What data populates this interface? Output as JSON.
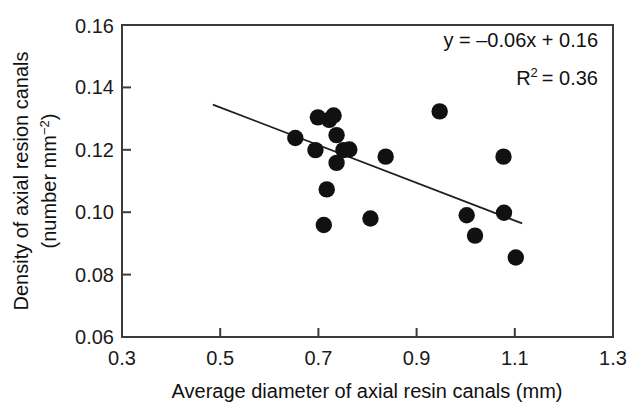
{
  "chart_data": {
    "type": "scatter",
    "title": "",
    "xlabel": "Average diameter of axial resin canals (mm)",
    "ylabel_line1": "Density of axial resion canals",
    "ylabel_line2_pre": "(number mm",
    "ylabel_line2_sup": "−2",
    "ylabel_line2_post": ")",
    "xlim": [
      0.3,
      1.3
    ],
    "ylim": [
      0.06,
      0.16
    ],
    "xticks": [
      0.3,
      0.5,
      0.7,
      0.9,
      1.1,
      1.3
    ],
    "xtick_labels": [
      "0.3",
      "0.5",
      "0.7",
      "0.9",
      "1.1",
      "1.3"
    ],
    "yticks": [
      0.06,
      0.08,
      0.1,
      0.12,
      0.14,
      0.16
    ],
    "ytick_labels": [
      "0.06",
      "0.08",
      "0.10",
      "0.12",
      "0.14",
      "0.16"
    ],
    "grid": false,
    "legend": null,
    "marker": "filled-circle",
    "marker_color": "#111111",
    "points": [
      {
        "x": 0.653,
        "y": 0.1238
      },
      {
        "x": 0.694,
        "y": 0.1199
      },
      {
        "x": 0.699,
        "y": 0.1304
      },
      {
        "x": 0.722,
        "y": 0.1296
      },
      {
        "x": 0.717,
        "y": 0.1073
      },
      {
        "x": 0.711,
        "y": 0.0959
      },
      {
        "x": 0.731,
        "y": 0.131
      },
      {
        "x": 0.737,
        "y": 0.1247
      },
      {
        "x": 0.737,
        "y": 0.1158
      },
      {
        "x": 0.751,
        "y": 0.1199
      },
      {
        "x": 0.763,
        "y": 0.1201
      },
      {
        "x": 0.806,
        "y": 0.098
      },
      {
        "x": 0.837,
        "y": 0.1178
      },
      {
        "x": 0.947,
        "y": 0.1323
      },
      {
        "x": 1.002,
        "y": 0.099
      },
      {
        "x": 1.019,
        "y": 0.0925
      },
      {
        "x": 1.077,
        "y": 0.1178
      },
      {
        "x": 1.078,
        "y": 0.0998
      },
      {
        "x": 1.102,
        "y": 0.0855
      }
    ],
    "fit_line": {
      "equation": "y = –0.06x + 0.16",
      "slope": -0.06,
      "intercept": 0.16,
      "r_squared_label": "R",
      "r_squared_sup": "2",
      "r_squared_value": "= 0.36",
      "x_start": 0.485,
      "y_start": 0.1345,
      "x_end": 1.115,
      "y_end": 0.0964
    },
    "annotations": [
      "y = –0.06x + 0.16",
      "R² = 0.36"
    ]
  }
}
